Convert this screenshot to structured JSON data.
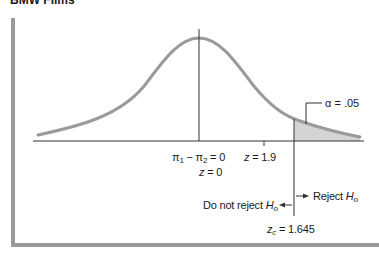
{
  "header": {
    "title": "BMW Films"
  },
  "diagram": {
    "type": "normal-distribution-right-tail-test",
    "labels": {
      "alpha": "α = .05",
      "null_diff_lhs": "π",
      "null_diff_sub1": "1",
      "null_diff_minus": " − π",
      "null_diff_sub2": "2",
      "null_diff_rhs": " = 0",
      "z_zero_var": "z",
      "z_zero_rhs": " = 0",
      "z_obs_var": "z",
      "z_obs_rhs": " = 1.9",
      "do_not_reject": "Do not reject ",
      "reject": "Reject ",
      "h_var": "H",
      "h_sub": "o",
      "zc_var": "z",
      "zc_sub": "c",
      "zc_rhs": " = 1.645"
    },
    "values": {
      "alpha": 0.05,
      "z_observed": 1.9,
      "z_critical": 1.645,
      "mean_z": 0
    },
    "colors": {
      "curve": "#9a9a9a",
      "shade": "#d4d4d4",
      "axis": "#333333",
      "frame": "#9a9a9a"
    }
  }
}
